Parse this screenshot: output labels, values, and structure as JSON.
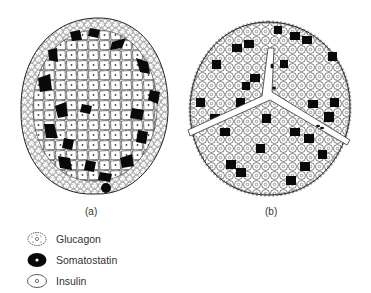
{
  "figure": {
    "panels": [
      {
        "id": "a",
        "label": "(a)"
      },
      {
        "id": "b",
        "label": "(b)"
      }
    ]
  },
  "legend": {
    "items": [
      {
        "label": "Glucagon",
        "icon": "glucagon-cell-icon"
      },
      {
        "label": "Somatostatin",
        "icon": "somatostatin-cell-icon"
      },
      {
        "label": "Insulin",
        "icon": "insulin-cell-icon"
      }
    ]
  },
  "colors": {
    "outline": "#222222",
    "somatostatin": "#0a0a0a",
    "background": "#ffffff"
  }
}
